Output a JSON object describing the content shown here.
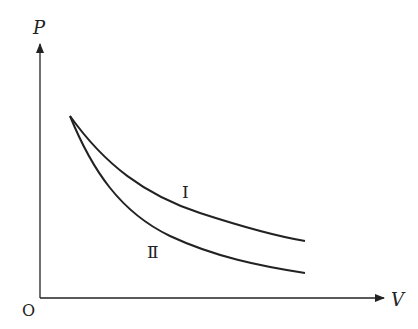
{
  "diagram": {
    "type": "P-V graph",
    "axes": {
      "y_label": "P",
      "x_label": "V",
      "origin_label": "O"
    },
    "curves": [
      {
        "id": "curve-1",
        "label": "I",
        "description": "upper curve, decreases more gently"
      },
      {
        "id": "curve-2",
        "label": "Ⅱ",
        "description": "lower curve, decreases more steeply"
      }
    ],
    "colors": {
      "stroke": "#222222",
      "background": "#ffffff"
    }
  }
}
